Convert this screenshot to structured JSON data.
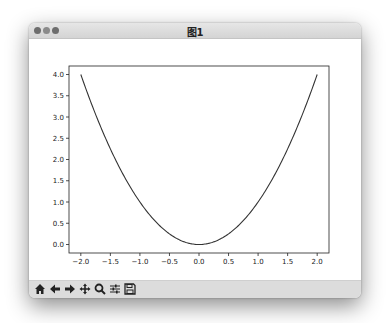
{
  "window": {
    "title": "图1",
    "traffic_lights": [
      "close",
      "minimize",
      "zoom"
    ]
  },
  "toolbar": {
    "buttons": [
      {
        "name": "home",
        "icon": "home-icon",
        "glyph": "🏠"
      },
      {
        "name": "back",
        "icon": "arrow-left-icon",
        "glyph": "🡐"
      },
      {
        "name": "forward",
        "icon": "arrow-right-icon",
        "glyph": "🡒"
      },
      {
        "name": "pan",
        "icon": "move-icon",
        "glyph": "✥"
      },
      {
        "name": "zoom",
        "icon": "magnifier-icon",
        "glyph": "🔍"
      },
      {
        "name": "configure-subplots",
        "icon": "sliders-icon",
        "glyph": "☰"
      },
      {
        "name": "save",
        "icon": "save-icon",
        "glyph": "💾"
      }
    ]
  },
  "chart_data": {
    "type": "line",
    "title": "",
    "xlabel": "",
    "ylabel": "",
    "function": "y = x^2",
    "series": [
      {
        "name": "x^2",
        "color": "#333333",
        "x": [
          -2.0,
          -1.75,
          -1.5,
          -1.25,
          -1.0,
          -0.75,
          -0.5,
          -0.25,
          0.0,
          0.25,
          0.5,
          0.75,
          1.0,
          1.25,
          1.5,
          1.75,
          2.0
        ],
        "y": [
          4.0,
          3.0625,
          2.25,
          1.5625,
          1.0,
          0.5625,
          0.25,
          0.0625,
          0.0,
          0.0625,
          0.25,
          0.5625,
          1.0,
          1.5625,
          2.25,
          3.0625,
          4.0
        ]
      }
    ],
    "xticks": [
      "−2.0",
      "−1.5",
      "−1.0",
      "−0.5",
      "0.0",
      "0.5",
      "1.0",
      "1.5",
      "2.0"
    ],
    "xtick_values": [
      -2.0,
      -1.5,
      -1.0,
      -0.5,
      0.0,
      0.5,
      1.0,
      1.5,
      2.0
    ],
    "yticks": [
      "0.0",
      "0.5",
      "1.0",
      "1.5",
      "2.0",
      "2.5",
      "3.0",
      "3.5",
      "4.0"
    ],
    "ytick_values": [
      0.0,
      0.5,
      1.0,
      1.5,
      2.0,
      2.5,
      3.0,
      3.5,
      4.0
    ],
    "xlim": [
      -2.2,
      2.2
    ],
    "ylim": [
      -0.2,
      4.2
    ],
    "grid": false,
    "legend": null
  }
}
